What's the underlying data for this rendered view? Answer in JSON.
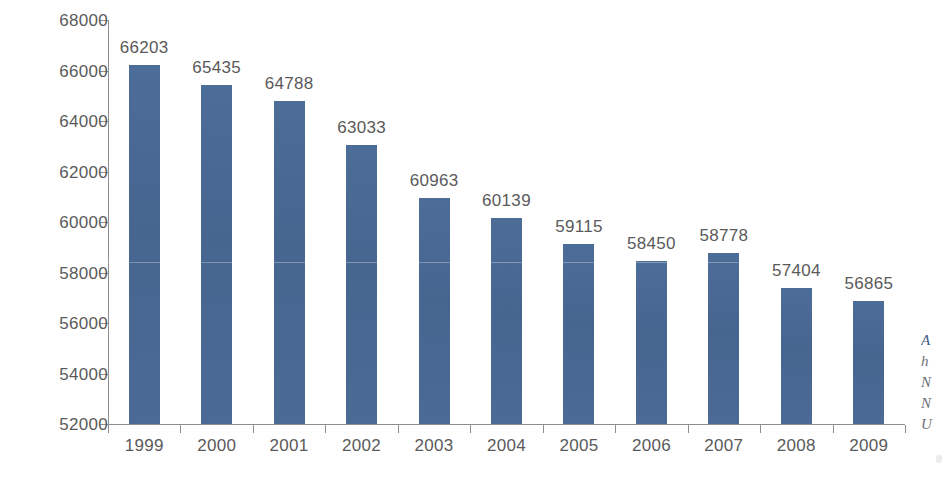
{
  "chart_data": {
    "type": "bar",
    "title": "",
    "subtitle": "",
    "xlabel": "",
    "ylabel": "",
    "categories": [
      "1999",
      "2000",
      "2001",
      "2002",
      "2003",
      "2004",
      "2005",
      "2006",
      "2007",
      "2008",
      "2009"
    ],
    "values": [
      66203,
      65435,
      64788,
      63033,
      60963,
      60139,
      59115,
      58450,
      58778,
      57404,
      56865
    ],
    "data_labels": [
      "66203",
      "65435",
      "64788",
      "63033",
      "60963",
      "60139",
      "59115",
      "58450",
      "58778",
      "57404",
      "56865"
    ],
    "ylim": [
      52000,
      68000
    ],
    "ytick_values": [
      52000,
      54000,
      56000,
      58000,
      60000,
      62000,
      64000,
      66000,
      68000
    ],
    "ytick_labels": [
      "52000",
      "54000",
      "56000",
      "58000",
      "60000",
      "62000",
      "64000",
      "66000",
      "68000"
    ],
    "ytick_step": 2000,
    "grid": false,
    "legend": null,
    "legend_position": "none",
    "series_color": "#4a6a96",
    "axis_color": "#8f8f8f",
    "label_color": "#5a5a5a",
    "background": "#ffffff"
  },
  "side_note": {
    "clipped": true,
    "lines": [
      "A",
      "h",
      "N",
      "N",
      "U"
    ]
  }
}
